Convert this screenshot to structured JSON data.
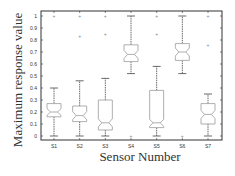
{
  "chart_data": {
    "type": "boxplot",
    "title": "",
    "xlabel": "Sensor Number",
    "ylabel": "Maximum response value",
    "ylim": [
      0,
      1
    ],
    "yticks": [
      "0",
      "0.1",
      "0.2",
      "0.3",
      "0.4",
      "0.5",
      "0.6",
      "0.7",
      "0.8",
      "0.9",
      "1"
    ],
    "notched": true,
    "grid": false,
    "categories": [
      "S1",
      "S2",
      "S3",
      "S4",
      "S5",
      "S6",
      "S7"
    ],
    "series": [
      {
        "name": "S1",
        "whislo": 0.0,
        "q1": 0.16,
        "median": 0.2,
        "q3": 0.27,
        "whishi": 0.4,
        "outliers": [
          1.0
        ]
      },
      {
        "name": "S2",
        "whislo": 0.0,
        "q1": 0.12,
        "median": 0.17,
        "q3": 0.25,
        "whishi": 0.46,
        "outliers": [
          1.0,
          0.83
        ]
      },
      {
        "name": "S3",
        "whislo": 0.0,
        "q1": 0.05,
        "median": 0.11,
        "q3": 0.3,
        "whishi": 0.48,
        "outliers": [
          1.0,
          0.85
        ]
      },
      {
        "name": "S4",
        "whislo": 0.52,
        "q1": 0.62,
        "median": 0.68,
        "q3": 0.76,
        "whishi": 1.0,
        "outliers": [
          0.0
        ]
      },
      {
        "name": "S5",
        "whislo": 0.0,
        "q1": 0.07,
        "median": 0.11,
        "q3": 0.38,
        "whishi": 0.58,
        "outliers": [
          1.0,
          0.85
        ]
      },
      {
        "name": "S6",
        "whislo": 0.52,
        "q1": 0.63,
        "median": 0.7,
        "q3": 0.77,
        "whishi": 1.0,
        "outliers": [
          0.0
        ]
      },
      {
        "name": "S7",
        "whislo": 0.0,
        "q1": 0.1,
        "median": 0.18,
        "q3": 0.27,
        "whishi": 0.35,
        "outliers": [
          1.0,
          0.76
        ]
      }
    ]
  },
  "colors": {
    "axis": "#333333",
    "box": "#9a9a9a",
    "whisker": "#444444",
    "outlier": "#888888",
    "text": "#333333"
  }
}
